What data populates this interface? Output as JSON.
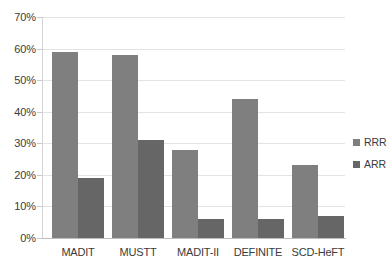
{
  "chart_data": {
    "type": "bar",
    "title": "",
    "subtitle": "",
    "xlabel": "",
    "ylabel": "",
    "ylim": [
      0,
      70
    ],
    "ytick_values": [
      0,
      10,
      20,
      30,
      40,
      50,
      60,
      70
    ],
    "ytick_labels": [
      "0%",
      "10%",
      "20%",
      "30%",
      "40%",
      "50%",
      "60%",
      "70%"
    ],
    "grid": true,
    "legend_position": "right",
    "categories": [
      "MADIT",
      "MUSTT",
      "MADIT-II",
      "DEFINITE",
      "SCD-HeFT"
    ],
    "series": [
      {
        "name": "RRR",
        "color": "#7f7f7f",
        "values": [
          59,
          58,
          28,
          44,
          23
        ]
      },
      {
        "name": "ARR",
        "color": "#666666",
        "values": [
          19,
          31,
          6,
          6,
          7
        ]
      }
    ]
  },
  "legend": {
    "items": [
      {
        "label": "RRR",
        "color": "#7f7f7f"
      },
      {
        "label": "ARR",
        "color": "#666666"
      }
    ]
  },
  "axes": {
    "y": {
      "labels": [
        "70%",
        "60%",
        "50%",
        "40%",
        "30%",
        "20%",
        "10%",
        "0%"
      ]
    },
    "x": {
      "labels": [
        "MADIT",
        "MUSTT",
        "MADIT-II",
        "DEFINITE",
        "SCD-HeFT"
      ]
    }
  }
}
